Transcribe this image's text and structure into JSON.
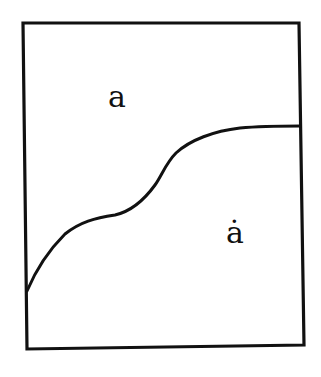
{
  "diagram": {
    "type": "region-partition",
    "stroke_color": "#111111",
    "background_color": "#ffffff",
    "frame": {
      "corners": [
        [
          23,
          23
        ],
        [
          299,
          23
        ],
        [
          304,
          345
        ],
        [
          27,
          349
        ]
      ]
    },
    "boundary_curve": {
      "points": [
        [
          27,
          291
        ],
        [
          45,
          258
        ],
        [
          65,
          234
        ],
        [
          88,
          221
        ],
        [
          115,
          215
        ],
        [
          135,
          205
        ],
        [
          155,
          185
        ],
        [
          170,
          160
        ],
        [
          185,
          146
        ],
        [
          210,
          135
        ],
        [
          240,
          128
        ],
        [
          270,
          126
        ],
        [
          300,
          126
        ]
      ]
    },
    "regions": [
      {
        "id": "upper",
        "label": "a"
      },
      {
        "id": "lower",
        "label": "ȧ"
      }
    ]
  }
}
